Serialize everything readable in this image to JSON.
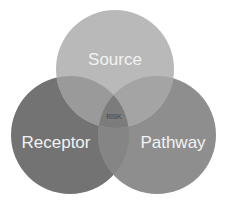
{
  "diagram": {
    "type": "venn",
    "circles": [
      {
        "id": "source",
        "label": "Source",
        "cx": 115,
        "cy": 69,
        "r": 59,
        "color": "#b9b9b9"
      },
      {
        "id": "receptor",
        "label": "Receptor",
        "cx": 70,
        "cy": 135,
        "r": 59,
        "color": "#737373"
      },
      {
        "id": "pathway",
        "label": "Pathway",
        "cx": 157,
        "cy": 135,
        "r": 59,
        "color": "#8e8e8e"
      }
    ],
    "center_label": "RISK",
    "overlap_colors": {
      "source_receptor": "#9a9a9a",
      "source_pathway": "#a3a3a3",
      "receptor_pathway": "#858585",
      "all": "#7a7a7a"
    }
  }
}
